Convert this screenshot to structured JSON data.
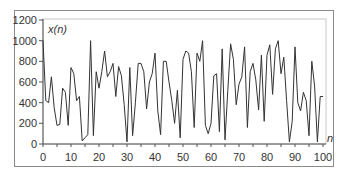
{
  "chart_data": {
    "type": "line",
    "title": "",
    "xlabel": "n",
    "ylabel": "x(n)",
    "xlim": [
      0,
      100
    ],
    "ylim": [
      0,
      1200
    ],
    "grid": false,
    "legend": "none",
    "x_ticks": [
      0,
      10,
      20,
      30,
      40,
      50,
      60,
      70,
      80,
      90,
      100
    ],
    "y_ticks": [
      0,
      200,
      400,
      600,
      800,
      1000,
      1200
    ],
    "line_color": "#333333",
    "series": [
      {
        "name": "x(n)",
        "x": [
          0,
          1,
          2,
          3,
          4,
          5,
          6,
          7,
          8,
          9,
          10,
          11,
          12,
          13,
          14,
          15,
          16,
          17,
          18,
          19,
          20,
          21,
          22,
          23,
          24,
          25,
          26,
          27,
          28,
          29,
          30,
          31,
          32,
          33,
          34,
          35,
          36,
          37,
          38,
          39,
          40,
          41,
          42,
          43,
          44,
          45,
          46,
          47,
          48,
          49,
          50,
          51,
          52,
          53,
          54,
          55,
          56,
          57,
          58,
          59,
          60,
          61,
          62,
          63,
          64,
          65,
          66,
          67,
          68,
          69,
          70,
          71,
          72,
          73,
          74,
          75,
          76,
          77,
          78,
          79,
          80,
          81,
          82,
          83,
          84,
          85,
          86,
          87,
          88,
          89,
          90,
          91,
          92,
          93,
          94,
          95,
          96,
          97,
          98,
          99,
          100
        ],
        "values": [
          1000,
          420,
          400,
          650,
          350,
          180,
          190,
          540,
          500,
          180,
          740,
          680,
          420,
          460,
          30,
          60,
          90,
          1000,
          80,
          700,
          540,
          700,
          900,
          650,
          700,
          780,
          460,
          750,
          660,
          380,
          20,
          740,
          80,
          400,
          780,
          780,
          700,
          340,
          600,
          680,
          880,
          320,
          90,
          800,
          800,
          600,
          420,
          200,
          520,
          60,
          820,
          900,
          880,
          700,
          160,
          880,
          800,
          1000,
          180,
          100,
          200,
          660,
          680,
          120,
          920,
          40,
          520,
          970,
          820,
          380,
          580,
          650,
          940,
          160,
          700,
          780,
          620,
          330,
          860,
          220,
          860,
          960,
          480,
          920,
          1000,
          680,
          840,
          420,
          20,
          220,
          940,
          400,
          320,
          500,
          420,
          80,
          800,
          560,
          20,
          460,
          460
        ]
      }
    ]
  },
  "labels": {
    "y_axis_title": "x(n)",
    "x_axis_title": "n"
  }
}
